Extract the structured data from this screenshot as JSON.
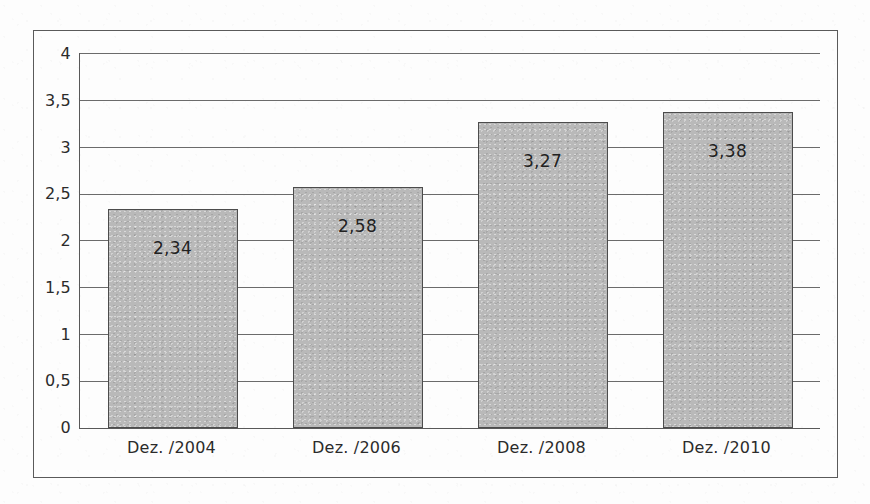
{
  "chart_data": {
    "type": "bar",
    "title": "",
    "subtitle": "",
    "xlabel": "",
    "ylabel": "",
    "categories": [
      "Dez. /2004",
      "Dez. /2006",
      "Dez. /2008",
      "Dez. /2010"
    ],
    "values": [
      2.34,
      2.58,
      3.27,
      3.38
    ],
    "value_labels": [
      "2,34",
      "2,58",
      "3,27",
      "3,38"
    ],
    "ylim": [
      0,
      4
    ],
    "ytick_values": [
      0,
      0.5,
      1,
      1.5,
      2,
      2.5,
      3,
      3.5,
      4
    ],
    "ytick_labels": [
      "0",
      "0,5",
      "1",
      "1,5",
      "2",
      "2,5",
      "3",
      "3,5",
      "4"
    ],
    "grid": true,
    "grid_axis": "y",
    "legend": false,
    "legend_position": "none",
    "bar_color": "#b9b9b9",
    "bar_border_color": "#4c4c4c",
    "axis_color": "#585858",
    "grid_color": "#6b6b6b",
    "text_color": "#2b2b2b",
    "background_color": "#fdfdfd",
    "frame_color": "#5a5a5a"
  }
}
